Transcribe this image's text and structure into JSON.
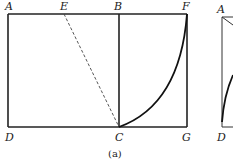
{
  "figure": {
    "caption": "(a)",
    "points": {
      "A": "A",
      "E": "E",
      "B": "B",
      "F": "F",
      "D": "D",
      "C": "C",
      "G": "G"
    },
    "segments": [
      {
        "name": "AF",
        "style": "solid"
      },
      {
        "name": "DG",
        "style": "solid"
      },
      {
        "name": "AD",
        "style": "solid"
      },
      {
        "name": "FG",
        "style": "solid"
      },
      {
        "name": "BC",
        "style": "solid"
      },
      {
        "name": "EC",
        "style": "dashed"
      },
      {
        "name": "CF",
        "style": "arc"
      }
    ]
  },
  "partial_figure": {
    "points": {
      "A": "A",
      "D": "D"
    }
  }
}
